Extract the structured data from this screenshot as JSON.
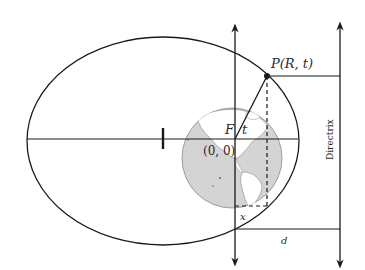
{
  "diagram": {
    "labels": {
      "point": "P(R, t)",
      "focus": "F",
      "angle": "t",
      "origin": "(0, 0)",
      "x": "x",
      "d": "d",
      "directrix": "Directrix"
    },
    "colors": {
      "line": "#1a1a1a",
      "globe_land": "#ffffff",
      "globe_ocean": "#d4d4d4",
      "globe_outline": "#8a8a8a"
    }
  }
}
